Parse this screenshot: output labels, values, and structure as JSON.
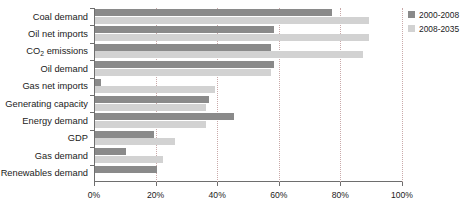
{
  "chart_data": {
    "type": "bar",
    "orientation": "horizontal",
    "title": "",
    "xlabel": "",
    "ylabel": "",
    "xlim": [
      0,
      100
    ],
    "xticks": [
      "0%",
      "20%",
      "40%",
      "60%",
      "80%",
      "100%"
    ],
    "xtick_values": [
      0,
      20,
      40,
      60,
      80,
      100
    ],
    "grid": "vertical-dotted",
    "legend_position": "right",
    "categories": [
      "Coal demand",
      "Oil net imports",
      "CO2 emissions",
      "Oil demand",
      "Gas net imports",
      "Generating capacity",
      "Energy demand",
      "GDP",
      "Gas demand",
      "Renewables demand"
    ],
    "series": [
      {
        "name": "2000-2008",
        "color": "#8a8a8a",
        "values": [
          77,
          58,
          57,
          58,
          2,
          37,
          45,
          19,
          10,
          20
        ]
      },
      {
        "name": "2008-2035",
        "color": "#d2d2d2",
        "values": [
          89,
          89,
          87,
          57,
          39,
          36,
          36,
          26,
          22,
          0
        ]
      }
    ]
  },
  "labels": {
    "rows": [
      {
        "text": "Coal demand",
        "sub": ""
      },
      {
        "text": "Oil net imports",
        "sub": ""
      },
      {
        "text": "CO",
        "sub": "2",
        "tail": " emissions"
      },
      {
        "text": "Oil demand",
        "sub": ""
      },
      {
        "text": "Gas net imports",
        "sub": ""
      },
      {
        "text": "Generating capacity",
        "sub": ""
      },
      {
        "text": "Energy demand",
        "sub": ""
      },
      {
        "text": "GDP",
        "sub": ""
      },
      {
        "text": "Gas demand",
        "sub": ""
      },
      {
        "text": "Renewables demand",
        "sub": ""
      }
    ]
  },
  "legend": {
    "items": [
      {
        "label": "2000-2008",
        "color": "#8a8a8a"
      },
      {
        "label": "2008-2035",
        "color": "#d2d2d2"
      }
    ]
  },
  "colors": {
    "series_1": "#8a8a8a",
    "series_2": "#d2d2d2",
    "axis": "#6e6e6e",
    "grid": "#c9a9a9",
    "text": "#1b1b1b",
    "background": "#ffffff"
  }
}
